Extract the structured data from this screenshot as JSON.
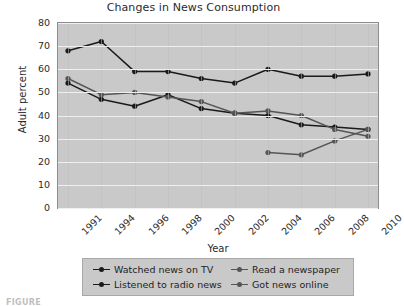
{
  "chart_data": {
    "type": "line",
    "title": "Changes in News Consumption",
    "xlabel": "Year",
    "ylabel": "Adult percent",
    "categories": [
      "1991",
      "1994",
      "1996",
      "1998",
      "2000",
      "2002",
      "2004",
      "2006",
      "2008",
      "2010"
    ],
    "x": [
      1991,
      1994,
      1996,
      1998,
      2000,
      2002,
      2004,
      2006,
      2008,
      2010
    ],
    "ylim": [
      0,
      80
    ],
    "yticks": [
      0,
      10,
      20,
      30,
      40,
      50,
      60,
      70,
      80
    ],
    "grid": true,
    "legend_position": "bottom",
    "series": [
      {
        "name": "Watched news on TV",
        "color": "#1a1a1a",
        "values": [
          68,
          72,
          59,
          59,
          56,
          54,
          60,
          57,
          57,
          58
        ]
      },
      {
        "name": "Listened to radio news",
        "color": "#1a1a1a",
        "values": [
          54,
          47,
          44,
          49,
          43,
          41,
          40,
          36,
          35,
          34
        ]
      },
      {
        "name": "Read a newspaper",
        "color": "#555555",
        "values": [
          56,
          49,
          50,
          48,
          46,
          41,
          42,
          40,
          34,
          31
        ]
      },
      {
        "name": "Got news online",
        "color": "#555555",
        "values": [
          null,
          null,
          null,
          null,
          null,
          null,
          24,
          23,
          29,
          34
        ]
      }
    ]
  },
  "legend": {
    "items": [
      {
        "label": "Watched news on TV",
        "color": "#1a1a1a"
      },
      {
        "label": "Read a newspaper",
        "color": "#555555"
      },
      {
        "label": "Listened to radio news",
        "color": "#1a1a1a"
      },
      {
        "label": "Got news online",
        "color": "#555555"
      }
    ]
  },
  "caption": "FIGURE"
}
